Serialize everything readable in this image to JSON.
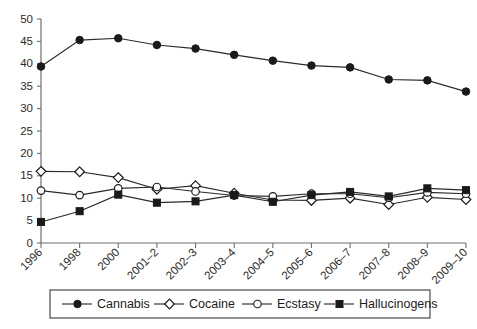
{
  "chart_data": {
    "type": "line",
    "title": "",
    "subtitle": "",
    "xlabel": "",
    "ylabel": "",
    "grid": false,
    "ylim": [
      0,
      50
    ],
    "ytick_step": 5,
    "yticks": [
      0,
      5,
      10,
      15,
      20,
      25,
      30,
      35,
      40,
      45,
      50
    ],
    "categories": [
      "1996",
      "1998",
      "2000",
      "2001–2",
      "2002–3",
      "2003–4",
      "2004–5",
      "2005–6",
      "2006–7",
      "2007–8",
      "2008–9",
      "2009–10"
    ],
    "legend_position": "bottom",
    "series": [
      {
        "name": "Cannabis",
        "marker": "filled-circle",
        "color": "#1a1a1a",
        "values": [
          39.4,
          45.3,
          45.7,
          44.2,
          43.4,
          42.0,
          40.7,
          39.6,
          39.2,
          36.5,
          36.3,
          33.8
        ]
      },
      {
        "name": "Cocaine",
        "marker": "open-diamond",
        "color": "#1a1a1a",
        "values": [
          16.0,
          15.9,
          14.6,
          12.0,
          12.8,
          11.1,
          9.6,
          9.5,
          10.0,
          8.6,
          10.2,
          9.7
        ]
      },
      {
        "name": "Ecstasy",
        "marker": "open-circle",
        "color": "#1a1a1a",
        "values": [
          11.7,
          10.7,
          12.2,
          12.5,
          11.5,
          10.6,
          10.4,
          11.0,
          11.0,
          10.1,
          11.3,
          11.0
        ]
      },
      {
        "name": "Hallucinogens",
        "marker": "filled-square",
        "color": "#1a1a1a",
        "values": [
          4.7,
          7.1,
          10.8,
          9.0,
          9.3,
          10.7,
          9.2,
          10.7,
          11.4,
          10.4,
          12.2,
          11.8
        ]
      }
    ]
  },
  "legend": {
    "items": [
      {
        "label": "Cannabis",
        "marker": "filled-circle"
      },
      {
        "label": "Cocaine",
        "marker": "open-diamond"
      },
      {
        "label": "Ecstasy",
        "marker": "open-circle"
      },
      {
        "label": "Hallucinogens",
        "marker": "filled-square"
      }
    ]
  }
}
